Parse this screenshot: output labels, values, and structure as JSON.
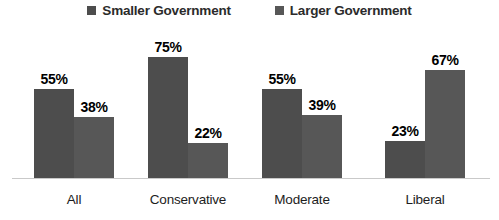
{
  "legend": {
    "position": "top-center",
    "items": [
      {
        "label": "Smaller Government",
        "swatch": "legend-swatch-icon",
        "color": "#4d4d4d"
      },
      {
        "label": "Larger Government",
        "swatch": "legend-swatch-icon",
        "color": "#575757"
      }
    ]
  },
  "chart_data": {
    "type": "bar",
    "title": "",
    "subtitle": "",
    "xlabel": "",
    "ylabel": "",
    "ylim": [
      0,
      100
    ],
    "grid": false,
    "legend_position": "top-center",
    "value_suffix": "%",
    "categories": [
      "All",
      "Conservative",
      "Moderate",
      "Liberal"
    ],
    "series": [
      {
        "name": "Smaller Government",
        "color": "#4d4d4d",
        "values": [
          55,
          75,
          55,
          23
        ],
        "labels": [
          "55%",
          "75%",
          "55%",
          "23%"
        ]
      },
      {
        "name": "Larger Government",
        "color": "#575757",
        "values": [
          38,
          22,
          39,
          67
        ],
        "labels": [
          "38%",
          "22%",
          "39%",
          "67%"
        ]
      }
    ]
  },
  "axis": {
    "baseline_color": "#c9c9c9"
  }
}
